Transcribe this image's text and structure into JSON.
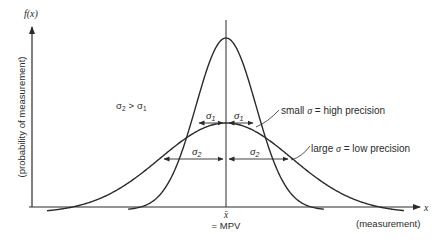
{
  "diagram": {
    "axes": {
      "y_label": "f(x)",
      "y_description": "(probability of measurement)",
      "x_label": "x",
      "x_description": "(measurement)"
    },
    "center": {
      "symbol": "x̄",
      "label": "= MPV"
    },
    "relation": {
      "lhs": "σ",
      "lhs_sub": "2",
      "op": ">",
      "rhs": "σ",
      "rhs_sub": "1"
    },
    "curves": [
      {
        "name": "narrow",
        "sigma_symbol": "σ",
        "sigma_sub": "1",
        "annotation_prefix": "small ",
        "annotation_sigma": "σ",
        "annotation_suffix": " = high precision"
      },
      {
        "name": "wide",
        "sigma_symbol": "σ",
        "sigma_sub": "2",
        "annotation_prefix": "large ",
        "annotation_sigma": "σ",
        "annotation_suffix": " = low precision"
      }
    ]
  },
  "chart_data": {
    "type": "line",
    "title": "",
    "xlabel": "x (measurement)",
    "ylabel": "f(x) (probability of measurement)",
    "series": [
      {
        "name": "small σ = high precision",
        "distribution": "normal",
        "mean": "x̄",
        "sigma": "σ1",
        "relative_peak": 1.0,
        "relative_sigma": 1.0
      },
      {
        "name": "large σ = low precision",
        "distribution": "normal",
        "mean": "x̄",
        "sigma": "σ2",
        "relative_peak": 0.5,
        "relative_sigma": 2.3
      }
    ],
    "annotations": [
      "σ2 > σ1",
      "x̄ = MPV",
      "σ1",
      "σ1",
      "σ2",
      "σ2"
    ],
    "grid": false
  }
}
